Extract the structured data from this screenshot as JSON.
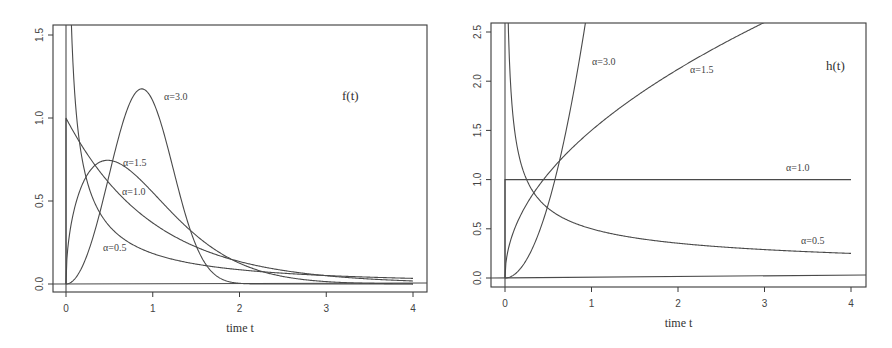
{
  "chart_data": [
    {
      "type": "line",
      "title": "f(t)",
      "xlabel": "time t",
      "ylabel": "",
      "xlim": [
        -0.15,
        4.15
      ],
      "ylim": [
        -0.04,
        1.57
      ],
      "grid": false,
      "legend": "inline curve labels",
      "x_ticks": [
        "0",
        "1",
        "2",
        "3",
        "4"
      ],
      "y_ticks": [
        "0.0",
        "0.5",
        "1.0",
        "1.5"
      ],
      "function": "Weibull density f(t) = alpha * t^(alpha-1) * exp(-t^alpha)",
      "series": [
        {
          "name": "α=0.5",
          "alpha": 0.5,
          "x": [
            0.05,
            0.25,
            0.5,
            1,
            2,
            3,
            4
          ],
          "values": [
            1.8,
            0.61,
            0.35,
            0.18,
            0.09,
            0.05,
            0.03
          ]
        },
        {
          "name": "α=1.0",
          "alpha": 1.0,
          "x": [
            0,
            0.5,
            1,
            2,
            3,
            4
          ],
          "values": [
            1.0,
            0.61,
            0.37,
            0.14,
            0.05,
            0.02
          ]
        },
        {
          "name": "α=1.5",
          "alpha": 1.5,
          "x": [
            0,
            0.5,
            1,
            2,
            3,
            4
          ],
          "values": [
            0.0,
            0.74,
            0.55,
            0.13,
            0.01,
            0.0
          ]
        },
        {
          "name": "α=3.0",
          "alpha": 3.0,
          "x": [
            0,
            0.5,
            0.87,
            1,
            1.5,
            2
          ],
          "values": [
            0.0,
            0.66,
            1.18,
            1.1,
            0.23,
            0.0
          ]
        }
      ],
      "annotations": [
        {
          "text": "α=3.0",
          "x": 1.15,
          "y": 1.16
        },
        {
          "text": "α=1.5",
          "x": 0.65,
          "y": 0.73
        },
        {
          "text": "α=1.0",
          "x": 0.63,
          "y": 0.55
        },
        {
          "text": "α=0.5",
          "x": 0.42,
          "y": 0.22
        },
        {
          "text": "f(t)",
          "x": 3.0,
          "y": 1.16
        }
      ]
    },
    {
      "type": "line",
      "title": "h(t)",
      "xlabel": "time t",
      "ylabel": "",
      "xlim": [
        -0.15,
        4.15
      ],
      "ylim": [
        -0.05,
        2.6
      ],
      "grid": false,
      "legend": "inline curve labels",
      "x_ticks": [
        "0",
        "1",
        "2",
        "3",
        "4"
      ],
      "y_ticks": [
        "0.0",
        "0.5",
        "1.0",
        "1.5",
        "2.0",
        "2.5"
      ],
      "function": "Weibull hazard h(t) = alpha * t^(alpha-1)",
      "series": [
        {
          "name": "α=0.5",
          "alpha": 0.5,
          "x": [
            0.04,
            0.25,
            0.5,
            1,
            2,
            3,
            4
          ],
          "values": [
            2.5,
            1.0,
            0.71,
            0.5,
            0.35,
            0.29,
            0.25
          ]
        },
        {
          "name": "α=1.0",
          "alpha": 1.0,
          "x": [
            0,
            1,
            2,
            3,
            4
          ],
          "values": [
            1.0,
            1.0,
            1.0,
            1.0,
            1.0
          ]
        },
        {
          "name": "α=1.5",
          "alpha": 1.5,
          "x": [
            0,
            0.5,
            1,
            2,
            3
          ],
          "values": [
            0.0,
            1.06,
            1.5,
            2.12,
            2.6
          ]
        },
        {
          "name": "α=3.0",
          "alpha": 3.0,
          "x": [
            0,
            0.5,
            0.6,
            0.8,
            0.93
          ],
          "values": [
            0.0,
            0.75,
            1.08,
            1.92,
            2.6
          ]
        }
      ],
      "annotations": [
        {
          "text": "α=3.0",
          "x": 1.0,
          "y": 2.2
        },
        {
          "text": "α=1.5",
          "x": 2.1,
          "y": 2.15
        },
        {
          "text": "α=1.0",
          "x": 3.25,
          "y": 1.05
        },
        {
          "text": "α=0.5",
          "x": 3.45,
          "y": 0.35
        },
        {
          "text": "h(t)",
          "x": 3.7,
          "y": 2.15
        }
      ]
    }
  ],
  "plots": [
    {
      "id": "density",
      "box": {
        "left": 53,
        "top": 25,
        "right": 427,
        "bottom": 292
      },
      "x_px": {
        "v0": 0,
        "p0": 66,
        "v1": 4,
        "p1": 413
      },
      "y_px": {
        "v0": 0,
        "p0": 284,
        "v1": 1.5,
        "p1": 35
      },
      "x_ticks": [
        {
          "v": 0,
          "label": "0"
        },
        {
          "v": 1,
          "label": "1"
        },
        {
          "v": 2,
          "label": "2"
        },
        {
          "v": 3,
          "label": "3"
        },
        {
          "v": 4,
          "label": "4"
        }
      ],
      "y_ticks": [
        {
          "v": 0,
          "label": "0.0"
        },
        {
          "v": 0.5,
          "label": "0.5"
        },
        {
          "v": 1.0,
          "label": "1.0"
        },
        {
          "v": 1.5,
          "label": "1.5"
        }
      ],
      "xlabel": "time t",
      "panel_label": {
        "text": "f(t)",
        "x": 342,
        "y": 100
      },
      "kind": "density",
      "alphas": [
        0.5,
        1.0,
        1.5,
        3.0
      ],
      "curve_labels": [
        {
          "text": "α=3.0",
          "x": 164,
          "y": 100
        },
        {
          "text": "α=1.5",
          "x": 123,
          "y": 166
        },
        {
          "text": "α=1.0",
          "x": 122,
          "y": 195
        },
        {
          "text": "α=0.5",
          "x": 103,
          "y": 251
        }
      ]
    },
    {
      "id": "hazard",
      "box": {
        "left": 491,
        "top": 23,
        "right": 866,
        "bottom": 287
      },
      "x_px": {
        "v0": 0,
        "p0": 505,
        "v1": 4,
        "p1": 851
      },
      "y_px": {
        "v0": 0,
        "p0": 278,
        "v1": 2.5,
        "p1": 32
      },
      "x_ticks": [
        {
          "v": 0,
          "label": "0"
        },
        {
          "v": 1,
          "label": "1"
        },
        {
          "v": 2,
          "label": "2"
        },
        {
          "v": 3,
          "label": "3"
        },
        {
          "v": 4,
          "label": "4"
        }
      ],
      "y_ticks": [
        {
          "v": 0,
          "label": "0.0"
        },
        {
          "v": 0.5,
          "label": "0.5"
        },
        {
          "v": 1.0,
          "label": "1.0"
        },
        {
          "v": 1.5,
          "label": "1.5"
        },
        {
          "v": 2.0,
          "label": "2.0"
        },
        {
          "v": 2.5,
          "label": "2.5"
        }
      ],
      "xlabel": "time t",
      "panel_label": {
        "text": "h(t)",
        "x": 826,
        "y": 70
      },
      "kind": "hazard",
      "alphas": [
        0.5,
        1.0,
        1.5,
        3.0
      ],
      "curve_labels": [
        {
          "text": "α=3.0",
          "x": 592,
          "y": 65
        },
        {
          "text": "α=1.5",
          "x": 690,
          "y": 73
        },
        {
          "text": "α=1.0",
          "x": 786,
          "y": 171
        },
        {
          "text": "α=0.5",
          "x": 801,
          "y": 244
        }
      ]
    }
  ]
}
